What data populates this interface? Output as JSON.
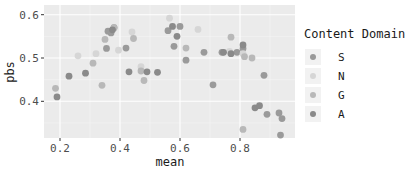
{
  "chart_data": {
    "type": "scatter",
    "title": "",
    "xlabel": "mean",
    "ylabel": "pbs",
    "xlim": [
      0.15,
      0.97
    ],
    "ylim": [
      0.31,
      0.61
    ],
    "x_ticks": [
      0.2,
      0.4,
      0.6,
      0.8
    ],
    "x_tick_labels": [
      "0.2",
      "0.4",
      "0.6",
      "0.8"
    ],
    "y_ticks": [
      0.4,
      0.5,
      0.6
    ],
    "y_tick_labels": [
      "0.4",
      "0.5",
      "0.6"
    ],
    "grid": true,
    "legend": {
      "title": "Content Domain",
      "position": "right",
      "entries": [
        {
          "label": "S",
          "color": "#9a9a9a"
        },
        {
          "label": "N",
          "color": "#d6d6d6"
        },
        {
          "label": "G",
          "color": "#b8b8b8"
        },
        {
          "label": "A",
          "color": "#8a8a8a"
        }
      ]
    },
    "series": [
      {
        "name": "S",
        "color": "#9a9a9a",
        "points": [
          [
            0.36,
            0.562
          ],
          [
            0.37,
            0.558
          ],
          [
            0.38,
            0.57
          ],
          [
            0.355,
            0.522
          ],
          [
            0.42,
            0.523
          ],
          [
            0.56,
            0.563
          ],
          [
            0.58,
            0.527
          ],
          [
            0.6,
            0.573
          ],
          [
            0.62,
            0.495
          ],
          [
            0.68,
            0.513
          ],
          [
            0.71,
            0.438
          ],
          [
            0.74,
            0.513
          ],
          [
            0.79,
            0.513
          ],
          [
            0.81,
            0.522
          ],
          [
            0.88,
            0.46
          ],
          [
            0.89,
            0.37
          ],
          [
            0.93,
            0.373
          ],
          [
            0.94,
            0.36
          ],
          [
            0.935,
            0.322
          ]
        ]
      },
      {
        "name": "N",
        "color": "#d6d6d6",
        "points": [
          [
            0.26,
            0.505
          ],
          [
            0.32,
            0.51
          ],
          [
            0.395,
            0.518
          ],
          [
            0.44,
            0.56
          ],
          [
            0.47,
            0.48
          ],
          [
            0.565,
            0.592
          ],
          [
            0.66,
            0.566
          ],
          [
            0.765,
            0.515
          ],
          [
            0.81,
            0.51
          ]
        ]
      },
      {
        "name": "G",
        "color": "#b8b8b8",
        "points": [
          [
            0.185,
            0.43
          ],
          [
            0.35,
            0.543
          ],
          [
            0.31,
            0.488
          ],
          [
            0.34,
            0.437
          ],
          [
            0.445,
            0.545
          ],
          [
            0.47,
            0.47
          ],
          [
            0.48,
            0.448
          ],
          [
            0.62,
            0.523
          ],
          [
            0.77,
            0.548
          ],
          [
            0.815,
            0.503
          ],
          [
            0.84,
            0.5
          ],
          [
            0.81,
            0.335
          ],
          [
            0.38,
            0.57
          ]
        ]
      },
      {
        "name": "A",
        "color": "#8a8a8a",
        "points": [
          [
            0.19,
            0.41
          ],
          [
            0.23,
            0.458
          ],
          [
            0.285,
            0.465
          ],
          [
            0.375,
            0.565
          ],
          [
            0.43,
            0.468
          ],
          [
            0.49,
            0.468
          ],
          [
            0.525,
            0.467
          ],
          [
            0.575,
            0.573
          ],
          [
            0.59,
            0.55
          ],
          [
            0.745,
            0.513
          ],
          [
            0.77,
            0.51
          ],
          [
            0.81,
            0.53
          ],
          [
            0.85,
            0.385
          ],
          [
            0.865,
            0.39
          ]
        ]
      }
    ]
  }
}
